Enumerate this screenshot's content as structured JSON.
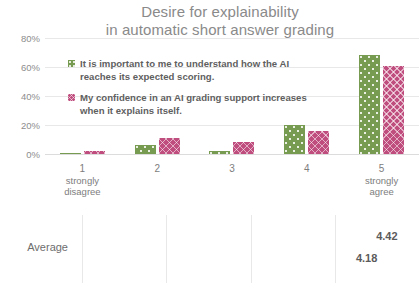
{
  "title": {
    "line1": "Desire for explainability",
    "line2": "in automatic short answer grading"
  },
  "legend": [
    {
      "swatch": "green",
      "color": "#769b51",
      "line1": "It is important to me to understand how the AI",
      "line2": "reaches its expected scoring."
    },
    {
      "swatch": "pink",
      "color": "#bf4d7d",
      "line1": "My confidence in an AI grading support increases",
      "line2": "when it explains itself."
    }
  ],
  "chart_data": [
    {
      "type": "bar",
      "title": "Desire for explainability in automatic short answer grading",
      "xlabel": "",
      "ylabel": "",
      "categories": [
        "1",
        "2",
        "3",
        "4",
        "5"
      ],
      "category_sublabels": [
        "strongly disagree",
        "",
        "",
        "",
        "strongly agree"
      ],
      "ytick_labels": [
        "0%",
        "20%",
        "40%",
        "60%",
        "80%"
      ],
      "ytick_values": [
        0,
        20,
        40,
        60,
        80
      ],
      "ylim": [
        0,
        80
      ],
      "grid": true,
      "legend_position": "inside-upper-left",
      "series": [
        {
          "name": "It is important to me to understand how the AI reaches its expected scoring.",
          "color": "#769b51",
          "values": [
            1,
            6,
            2,
            20,
            68
          ]
        },
        {
          "name": "My confidence in an AI grading support increases when it explains itself.",
          "color": "#bf4d7d",
          "values": [
            2,
            11,
            8,
            16,
            61
          ]
        }
      ]
    },
    {
      "type": "bar",
      "orientation": "horizontal",
      "title": "",
      "categories": [
        "Average"
      ],
      "xlim": [
        1,
        5
      ],
      "xtick_values": [
        1,
        2,
        3,
        4,
        5
      ],
      "grid": true,
      "series": [
        {
          "name": "It is important to me to understand how the AI reaches its expected scoring.",
          "color": "#769b51",
          "values": [
            4.42
          ],
          "labels": [
            "4.42"
          ]
        },
        {
          "name": "My confidence in an AI grading support increases when it explains itself.",
          "color": "#bf4d7d",
          "values": [
            4.18
          ],
          "labels": [
            "4.18"
          ]
        }
      ]
    }
  ],
  "axis": {
    "y_labels": [
      "80%",
      "60%",
      "40%",
      "20%",
      "0%"
    ],
    "x_ticks": [
      {
        "num": "1",
        "sub1": "strongly",
        "sub2": "disagree"
      },
      {
        "num": "2",
        "sub1": "",
        "sub2": ""
      },
      {
        "num": "3",
        "sub1": "",
        "sub2": ""
      },
      {
        "num": "4",
        "sub1": "",
        "sub2": ""
      },
      {
        "num": "5",
        "sub1": "strongly",
        "sub2": "agree"
      }
    ]
  },
  "average_section": {
    "label": "Average",
    "green_value": "4.42",
    "pink_value": "4.18"
  }
}
